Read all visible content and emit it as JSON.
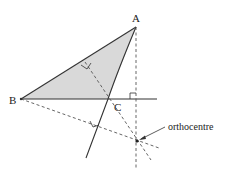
{
  "diagram": {
    "title_fragment": "",
    "colors": {
      "line": "#333333",
      "fill": "#d9d9d9",
      "dash": "#555555",
      "text": "#222222"
    },
    "points": {
      "A": {
        "label": "A",
        "x": 136,
        "y": 27
      },
      "B": {
        "label": "B",
        "x": 21,
        "y": 99
      },
      "C": {
        "label": "C",
        "x": 108,
        "y": 99
      },
      "H": {
        "label": "orthocentre",
        "x": 137,
        "y": 141
      }
    },
    "labels": {
      "A": "A",
      "B": "B",
      "C": "C",
      "orthocentre": "orthocentre"
    },
    "lines": {
      "triangle_fill": "A-B-C shaded",
      "base_extended": "BC extended beyond C",
      "side_AC_extended": "AC extended beyond C",
      "altitude_from_A": "dashed, perpendicular to extended BC",
      "altitude_from_B": "dashed, perpendicular to extended AC",
      "altitude_from_C": "dashed, perpendicular to AB"
    },
    "right_angle_markers": 3
  }
}
